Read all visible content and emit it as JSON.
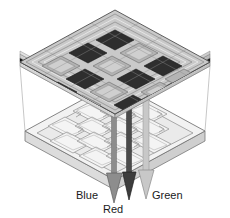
{
  "figure": {
    "title": "",
    "background_color": "#ffffff"
  },
  "labels": [
    {
      "id": "blue",
      "text": "Blue",
      "x": 76,
      "y": 199,
      "anchor": "start"
    },
    {
      "id": "red",
      "text": "Red",
      "x": 103,
      "y": 213,
      "anchor": "start"
    },
    {
      "id": "green",
      "text": "Green",
      "x": 152,
      "y": 199,
      "anchor": "start"
    }
  ],
  "arrows": [
    {
      "id": "blue-arrow",
      "label": "Blue",
      "color": "#7b7b7b",
      "stroke": "#4a4a4a",
      "x": 114,
      "top": 96,
      "tip": 203,
      "shaft_w": 5,
      "head_w": 15
    },
    {
      "id": "red-arrow",
      "label": "Red",
      "color": "#3c3c3c",
      "stroke": "#222222",
      "x": 129,
      "top": 96,
      "tip": 200,
      "shaft_w": 5,
      "head_w": 13
    },
    {
      "id": "green-arrow",
      "label": "Green",
      "color": "#c2c2c2",
      "stroke": "#8a8a8a",
      "x": 146,
      "top": 96,
      "tip": 199,
      "shaft_w": 6,
      "head_w": 15
    }
  ],
  "top_plate": {
    "id": "sensor-filter-die",
    "grid_rows": 4,
    "grid_cols": 4,
    "face_color": "#c9c9c9",
    "dark_pixel_color": "#303030",
    "light_pixel_color": "#b2b2b2",
    "black_layer_color": "#141414",
    "edge_layer_colors": [
      "#d8d8d8",
      "#bdbdbd",
      "#d8d8d8",
      "#141414",
      "#9a9a9a"
    ],
    "outline_color": "#5a5a5a"
  },
  "bottom_plate": {
    "id": "circuit-substrate",
    "grid_rows": 3,
    "grid_cols": 3,
    "face_color": "#f2f2f2",
    "slab_color": "#e9e9e9",
    "side_color": "#dcdcdc",
    "cell_fill": "#ededed",
    "outline_color": "#777777"
  },
  "guide_lines": {
    "id": "projection-guides",
    "color": "#b9b9b9",
    "count": 4
  },
  "colors": {
    "background": "#ffffff",
    "text": "#1a1a1a"
  }
}
